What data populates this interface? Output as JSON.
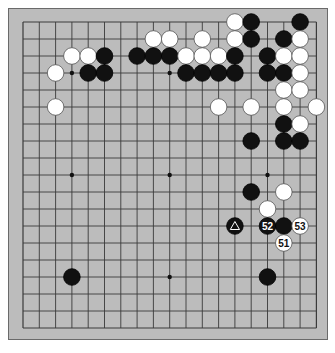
{
  "diagram": {
    "type": "go-board",
    "size": 19,
    "colors": {
      "board": "#bcbcbc",
      "grid": "#3a3a3a",
      "black": "#111111",
      "white": "#ffffff"
    },
    "star_points": [
      [
        3,
        3
      ],
      [
        9,
        3
      ],
      [
        15,
        3
      ],
      [
        3,
        9
      ],
      [
        9,
        9
      ],
      [
        15,
        9
      ],
      [
        3,
        15
      ],
      [
        9,
        15
      ],
      [
        15,
        15
      ]
    ],
    "stones": [
      {
        "c": "W",
        "x": 13,
        "y": 0
      },
      {
        "c": "B",
        "x": 14,
        "y": 0
      },
      {
        "c": "B",
        "x": 17,
        "y": 0
      },
      {
        "c": "W",
        "x": 8,
        "y": 1
      },
      {
        "c": "W",
        "x": 9,
        "y": 1
      },
      {
        "c": "W",
        "x": 11,
        "y": 1
      },
      {
        "c": "W",
        "x": 13,
        "y": 1
      },
      {
        "c": "B",
        "x": 14,
        "y": 1
      },
      {
        "c": "B",
        "x": 16,
        "y": 1
      },
      {
        "c": "W",
        "x": 17,
        "y": 1
      },
      {
        "c": "W",
        "x": 3,
        "y": 2
      },
      {
        "c": "W",
        "x": 4,
        "y": 2
      },
      {
        "c": "B",
        "x": 5,
        "y": 2
      },
      {
        "c": "B",
        "x": 7,
        "y": 2
      },
      {
        "c": "B",
        "x": 8,
        "y": 2
      },
      {
        "c": "B",
        "x": 9,
        "y": 2
      },
      {
        "c": "W",
        "x": 10,
        "y": 2
      },
      {
        "c": "W",
        "x": 11,
        "y": 2
      },
      {
        "c": "W",
        "x": 12,
        "y": 2
      },
      {
        "c": "B",
        "x": 13,
        "y": 2
      },
      {
        "c": "B",
        "x": 15,
        "y": 2
      },
      {
        "c": "W",
        "x": 16,
        "y": 2
      },
      {
        "c": "W",
        "x": 17,
        "y": 2
      },
      {
        "c": "W",
        "x": 2,
        "y": 3
      },
      {
        "c": "B",
        "x": 4,
        "y": 3
      },
      {
        "c": "B",
        "x": 5,
        "y": 3
      },
      {
        "c": "B",
        "x": 10,
        "y": 3
      },
      {
        "c": "B",
        "x": 11,
        "y": 3
      },
      {
        "c": "B",
        "x": 12,
        "y": 3
      },
      {
        "c": "B",
        "x": 13,
        "y": 3
      },
      {
        "c": "B",
        "x": 15,
        "y": 3
      },
      {
        "c": "B",
        "x": 16,
        "y": 3
      },
      {
        "c": "W",
        "x": 17,
        "y": 3
      },
      {
        "c": "W",
        "x": 16,
        "y": 4
      },
      {
        "c": "W",
        "x": 17,
        "y": 4
      },
      {
        "c": "W",
        "x": 2,
        "y": 5
      },
      {
        "c": "W",
        "x": 12,
        "y": 5
      },
      {
        "c": "W",
        "x": 14,
        "y": 5
      },
      {
        "c": "W",
        "x": 16,
        "y": 5
      },
      {
        "c": "W",
        "x": 18,
        "y": 5
      },
      {
        "c": "B",
        "x": 16,
        "y": 6
      },
      {
        "c": "W",
        "x": 17,
        "y": 6
      },
      {
        "c": "B",
        "x": 14,
        "y": 7
      },
      {
        "c": "B",
        "x": 16,
        "y": 7
      },
      {
        "c": "B",
        "x": 17,
        "y": 7
      },
      {
        "c": "B",
        "x": 14,
        "y": 10
      },
      {
        "c": "W",
        "x": 16,
        "y": 10
      },
      {
        "c": "W",
        "x": 15,
        "y": 11
      },
      {
        "c": "B",
        "x": 13,
        "y": 12,
        "mark": "triangle"
      },
      {
        "c": "B",
        "x": 15,
        "y": 12,
        "label": "52"
      },
      {
        "c": "B",
        "x": 16,
        "y": 12
      },
      {
        "c": "W",
        "x": 17,
        "y": 12,
        "label": "53"
      },
      {
        "c": "W",
        "x": 16,
        "y": 13,
        "label": "51"
      },
      {
        "c": "B",
        "x": 3,
        "y": 15
      },
      {
        "c": "B",
        "x": 15,
        "y": 15
      }
    ]
  }
}
